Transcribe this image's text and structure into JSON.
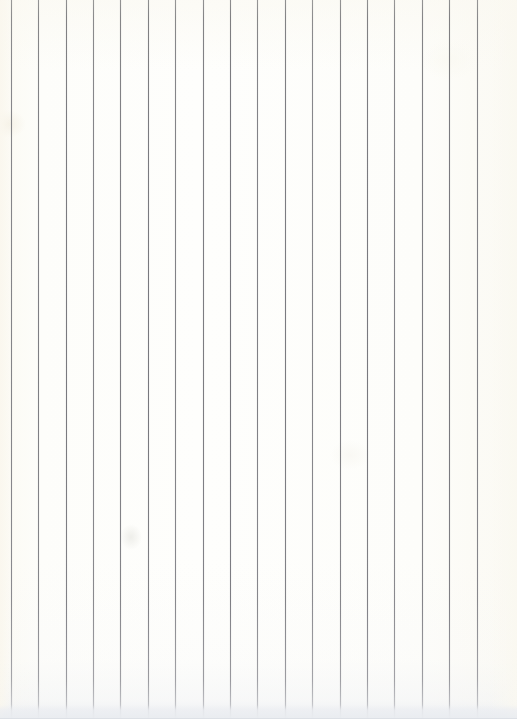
{
  "image": {
    "subject": "scanned sheet of vertically ruled paper",
    "width_px": 517,
    "height_px": 719,
    "orientation": "portrait",
    "text_content": "",
    "handwriting_present": "no",
    "printed_text_present": "no"
  },
  "paper": {
    "base_color": "#fdfdfa",
    "warm_tint_color": "#fbf9f2",
    "left_margin_color": "#fbf9f2",
    "right_margin_color": "#fbfaf4",
    "bottom_edge_band_color": "#e9ecf0",
    "description": "blank off-white paper, no writing"
  },
  "ruling": {
    "direction": "vertical",
    "line_color": "#75757b",
    "line_color_top": "#8e8e8e",
    "line_color_fade_bottom": "#dcdde1",
    "line_width_px": 1,
    "line_count": 18,
    "spacing_px": 27.3,
    "first_line_x_px": 11,
    "last_line_x_px": 490,
    "lines_x_px": [
      11,
      38,
      66,
      93,
      120,
      148,
      175,
      203,
      230,
      257,
      285,
      312,
      340,
      367,
      394,
      422,
      449,
      477
    ],
    "extends_top_to_bottom": "yes",
    "fade_start_y_px": 680,
    "fade_end_y_px": 715
  },
  "artifacts": {
    "bottom_edge_band_height_px": 14,
    "blotches": [
      {
        "name": "top-left-warm-patch",
        "x_px": 0,
        "y_px": 110
      },
      {
        "name": "mid-left-gray-smudge",
        "x_px": 131,
        "y_px": 536
      },
      {
        "name": "top-right-light-patch",
        "x_px": 440,
        "y_px": 55
      },
      {
        "name": "center-right-light-patch",
        "x_px": 345,
        "y_px": 452
      }
    ]
  }
}
